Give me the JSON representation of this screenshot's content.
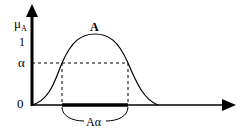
{
  "diagram": {
    "y_axis_label": "μ",
    "y_axis_subscript": "A",
    "tick_one": "1",
    "tick_alpha": "α",
    "origin": "0",
    "curve_label": "A",
    "cut_label": "Aα",
    "colors": {
      "line": "#000000",
      "background": "#ffffff"
    }
  }
}
